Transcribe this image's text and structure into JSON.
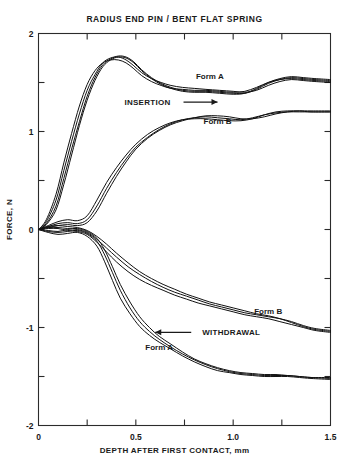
{
  "chart_data": {
    "type": "line",
    "title": "RADIUS END PIN / BENT FLAT SPRING",
    "xlabel": "DEPTH AFTER FIRST CONTACT, mm",
    "ylabel": "FORCE, N",
    "xlim": [
      0,
      1.5
    ],
    "ylim": [
      -2,
      2
    ],
    "grid": false,
    "legend_position": "inline-annotations",
    "xticks": [
      0,
      0.25,
      0.5,
      0.75,
      1.0,
      1.25,
      1.5
    ],
    "xtick_labels": [
      "0",
      "",
      "0.5",
      "",
      "1.0",
      "",
      "1.5"
    ],
    "yticks": [
      2,
      1.5,
      1,
      0.5,
      0,
      -0.5,
      -1,
      -1.5,
      -2
    ],
    "ytick_labels": [
      "2",
      "",
      "1",
      "",
      "0",
      "",
      "-1",
      "",
      "-2"
    ],
    "annotations": [
      {
        "text": "Form A",
        "x": 0.88,
        "y": 1.54,
        "group": "insertion"
      },
      {
        "text": "INSERTION",
        "x": 0.56,
        "y": 1.27,
        "group": "insertion",
        "arrow": "right"
      },
      {
        "text": "Form B",
        "x": 0.92,
        "y": 1.08,
        "group": "insertion"
      },
      {
        "text": "Form B",
        "x": 1.18,
        "y": -0.86,
        "group": "withdrawal"
      },
      {
        "text": "WITHDRAWAL",
        "x": 0.99,
        "y": -1.08,
        "group": "withdrawal",
        "arrow": "left"
      },
      {
        "text": "Form A",
        "x": 0.62,
        "y": -1.23,
        "group": "withdrawal"
      }
    ],
    "series": [
      {
        "name": "Form A insertion (trace 1)",
        "group": "insertion",
        "form": "A",
        "x": [
          0.0,
          0.04,
          0.09,
          0.13,
          0.17,
          0.21,
          0.25,
          0.29,
          0.33,
          0.37,
          0.41,
          0.45,
          0.49,
          0.53,
          0.58,
          0.63,
          0.68,
          0.74,
          0.8,
          0.86,
          0.93,
          1.0,
          1.06,
          1.12,
          1.18,
          1.24,
          1.3,
          1.36,
          1.42,
          1.5
        ],
        "y": [
          0.0,
          0.08,
          0.3,
          0.6,
          0.9,
          1.18,
          1.42,
          1.58,
          1.7,
          1.75,
          1.76,
          1.73,
          1.67,
          1.6,
          1.54,
          1.5,
          1.47,
          1.45,
          1.44,
          1.43,
          1.42,
          1.41,
          1.4,
          1.42,
          1.47,
          1.51,
          1.53,
          1.52,
          1.51,
          1.5
        ]
      },
      {
        "name": "Form A insertion (trace 2)",
        "group": "insertion",
        "form": "A",
        "x": [
          0.0,
          0.04,
          0.09,
          0.13,
          0.17,
          0.21,
          0.25,
          0.29,
          0.33,
          0.37,
          0.41,
          0.45,
          0.49,
          0.53,
          0.58,
          0.63,
          0.68,
          0.74,
          0.8,
          0.86,
          0.93,
          1.0,
          1.06,
          1.12,
          1.18,
          1.24,
          1.3,
          1.36,
          1.42,
          1.5
        ],
        "y": [
          0.0,
          0.06,
          0.24,
          0.52,
          0.82,
          1.1,
          1.36,
          1.55,
          1.68,
          1.74,
          1.77,
          1.76,
          1.71,
          1.63,
          1.55,
          1.49,
          1.45,
          1.42,
          1.41,
          1.41,
          1.4,
          1.39,
          1.39,
          1.43,
          1.49,
          1.53,
          1.55,
          1.54,
          1.53,
          1.52
        ]
      },
      {
        "name": "Form A insertion (trace 3)",
        "group": "insertion",
        "form": "A",
        "x": [
          0.0,
          0.04,
          0.09,
          0.13,
          0.17,
          0.21,
          0.25,
          0.29,
          0.33,
          0.37,
          0.41,
          0.45,
          0.49,
          0.53,
          0.58,
          0.63,
          0.68,
          0.74,
          0.8,
          0.86,
          0.93,
          1.0,
          1.06,
          1.12,
          1.18,
          1.24,
          1.3,
          1.36,
          1.42,
          1.5
        ],
        "y": [
          0.0,
          0.1,
          0.36,
          0.68,
          0.98,
          1.26,
          1.48,
          1.62,
          1.7,
          1.73,
          1.73,
          1.7,
          1.64,
          1.57,
          1.51,
          1.47,
          1.44,
          1.43,
          1.42,
          1.42,
          1.41,
          1.4,
          1.41,
          1.45,
          1.5,
          1.53,
          1.54,
          1.53,
          1.52,
          1.51
        ]
      },
      {
        "name": "Form A insertion (trace 4)",
        "group": "insertion",
        "form": "A",
        "x": [
          0.0,
          0.04,
          0.09,
          0.13,
          0.17,
          0.21,
          0.25,
          0.29,
          0.33,
          0.37,
          0.41,
          0.45,
          0.49,
          0.53,
          0.58,
          0.63,
          0.68,
          0.74,
          0.8,
          0.86,
          0.93,
          1.0,
          1.06,
          1.12,
          1.18,
          1.24,
          1.3,
          1.36,
          1.42,
          1.5
        ],
        "y": [
          0.0,
          0.05,
          0.2,
          0.46,
          0.76,
          1.06,
          1.32,
          1.52,
          1.66,
          1.73,
          1.76,
          1.75,
          1.7,
          1.62,
          1.54,
          1.48,
          1.44,
          1.41,
          1.4,
          1.4,
          1.39,
          1.38,
          1.39,
          1.44,
          1.5,
          1.54,
          1.56,
          1.55,
          1.54,
          1.53
        ]
      },
      {
        "name": "Form B insertion (trace 1)",
        "group": "insertion",
        "form": "B",
        "x": [
          0.0,
          0.05,
          0.1,
          0.15,
          0.2,
          0.25,
          0.3,
          0.35,
          0.4,
          0.45,
          0.5,
          0.56,
          0.62,
          0.68,
          0.74,
          0.8,
          0.86,
          0.92,
          0.98,
          1.04,
          1.1,
          1.16,
          1.22,
          1.28,
          1.34,
          1.4,
          1.5
        ],
        "y": [
          0.0,
          0.03,
          0.06,
          0.07,
          0.06,
          0.1,
          0.24,
          0.42,
          0.58,
          0.72,
          0.84,
          0.94,
          1.02,
          1.08,
          1.12,
          1.14,
          1.15,
          1.14,
          1.13,
          1.12,
          1.14,
          1.17,
          1.19,
          1.2,
          1.2,
          1.2,
          1.2
        ]
      },
      {
        "name": "Form B insertion (trace 2)",
        "group": "insertion",
        "form": "B",
        "x": [
          0.0,
          0.05,
          0.1,
          0.15,
          0.2,
          0.25,
          0.3,
          0.35,
          0.4,
          0.45,
          0.5,
          0.56,
          0.62,
          0.68,
          0.74,
          0.8,
          0.86,
          0.92,
          0.98,
          1.04,
          1.1,
          1.16,
          1.22,
          1.28,
          1.34,
          1.4,
          1.5
        ],
        "y": [
          0.0,
          0.04,
          0.08,
          0.1,
          0.09,
          0.14,
          0.3,
          0.48,
          0.63,
          0.76,
          0.87,
          0.97,
          1.04,
          1.09,
          1.12,
          1.13,
          1.13,
          1.12,
          1.11,
          1.11,
          1.13,
          1.17,
          1.2,
          1.21,
          1.21,
          1.2,
          1.2
        ]
      },
      {
        "name": "Form B insertion (trace 3)",
        "group": "insertion",
        "form": "B",
        "x": [
          0.0,
          0.05,
          0.1,
          0.15,
          0.2,
          0.25,
          0.3,
          0.35,
          0.4,
          0.45,
          0.5,
          0.56,
          0.62,
          0.68,
          0.74,
          0.8,
          0.86,
          0.92,
          0.98,
          1.04,
          1.1,
          1.16,
          1.22,
          1.28,
          1.34,
          1.4,
          1.5
        ],
        "y": [
          0.0,
          0.02,
          0.04,
          0.05,
          0.04,
          0.07,
          0.19,
          0.37,
          0.54,
          0.69,
          0.82,
          0.93,
          1.01,
          1.07,
          1.11,
          1.14,
          1.16,
          1.16,
          1.15,
          1.13,
          1.13,
          1.15,
          1.18,
          1.2,
          1.21,
          1.21,
          1.21
        ]
      },
      {
        "name": "Form A withdrawal (trace 1)",
        "group": "withdrawal",
        "form": "A",
        "x": [
          0.0,
          0.05,
          0.1,
          0.15,
          0.2,
          0.25,
          0.3,
          0.34,
          0.38,
          0.42,
          0.47,
          0.52,
          0.57,
          0.62,
          0.68,
          0.74,
          0.8,
          0.86,
          0.92,
          0.98,
          1.04,
          1.1,
          1.16,
          1.22,
          1.28,
          1.34,
          1.4,
          1.5
        ],
        "y": [
          0.0,
          -0.02,
          -0.03,
          -0.02,
          -0.01,
          -0.04,
          -0.12,
          -0.26,
          -0.44,
          -0.62,
          -0.8,
          -0.94,
          -1.04,
          -1.12,
          -1.2,
          -1.27,
          -1.33,
          -1.38,
          -1.42,
          -1.45,
          -1.47,
          -1.48,
          -1.49,
          -1.49,
          -1.49,
          -1.5,
          -1.51,
          -1.52
        ]
      },
      {
        "name": "Form A withdrawal (trace 2)",
        "group": "withdrawal",
        "form": "A",
        "x": [
          0.0,
          0.05,
          0.1,
          0.15,
          0.2,
          0.25,
          0.3,
          0.34,
          0.38,
          0.42,
          0.47,
          0.52,
          0.57,
          0.62,
          0.68,
          0.74,
          0.8,
          0.86,
          0.92,
          0.98,
          1.04,
          1.1,
          1.16,
          1.22,
          1.28,
          1.34,
          1.4,
          1.5
        ],
        "y": [
          0.0,
          -0.03,
          -0.05,
          -0.04,
          -0.03,
          -0.07,
          -0.17,
          -0.33,
          -0.52,
          -0.7,
          -0.86,
          -0.99,
          -1.08,
          -1.15,
          -1.22,
          -1.29,
          -1.35,
          -1.4,
          -1.44,
          -1.46,
          -1.48,
          -1.49,
          -1.5,
          -1.5,
          -1.5,
          -1.51,
          -1.52,
          -1.53
        ]
      },
      {
        "name": "Form A withdrawal (trace 3)",
        "group": "withdrawal",
        "form": "A",
        "x": [
          0.0,
          0.05,
          0.1,
          0.15,
          0.2,
          0.25,
          0.3,
          0.34,
          0.38,
          0.42,
          0.47,
          0.52,
          0.57,
          0.62,
          0.68,
          0.74,
          0.8,
          0.86,
          0.92,
          0.98,
          1.04,
          1.1,
          1.16,
          1.22,
          1.28,
          1.34,
          1.4,
          1.5
        ],
        "y": [
          0.0,
          -0.01,
          -0.02,
          0.0,
          0.01,
          -0.02,
          -0.09,
          -0.21,
          -0.38,
          -0.56,
          -0.74,
          -0.89,
          -1.0,
          -1.09,
          -1.17,
          -1.25,
          -1.32,
          -1.37,
          -1.41,
          -1.44,
          -1.46,
          -1.47,
          -1.48,
          -1.48,
          -1.49,
          -1.5,
          -1.51,
          -1.51
        ]
      },
      {
        "name": "Form B withdrawal (trace 1)",
        "group": "withdrawal",
        "form": "B",
        "x": [
          0.0,
          0.05,
          0.1,
          0.15,
          0.2,
          0.25,
          0.3,
          0.35,
          0.4,
          0.46,
          0.52,
          0.58,
          0.64,
          0.7,
          0.76,
          0.82,
          0.88,
          0.94,
          1.0,
          1.06,
          1.12,
          1.18,
          1.24,
          1.3,
          1.36,
          1.42,
          1.5
        ],
        "y": [
          0.0,
          0.02,
          0.02,
          0.01,
          0.0,
          -0.03,
          -0.1,
          -0.19,
          -0.28,
          -0.38,
          -0.46,
          -0.53,
          -0.59,
          -0.64,
          -0.68,
          -0.72,
          -0.76,
          -0.79,
          -0.82,
          -0.85,
          -0.87,
          -0.89,
          -0.91,
          -0.94,
          -0.98,
          -1.01,
          -1.03
        ]
      },
      {
        "name": "Form B withdrawal (trace 2)",
        "group": "withdrawal",
        "form": "B",
        "x": [
          0.0,
          0.05,
          0.1,
          0.15,
          0.2,
          0.25,
          0.3,
          0.35,
          0.4,
          0.46,
          0.52,
          0.58,
          0.64,
          0.7,
          0.76,
          0.82,
          0.88,
          0.94,
          1.0,
          1.06,
          1.12,
          1.18,
          1.24,
          1.3,
          1.36,
          1.42,
          1.5
        ],
        "y": [
          0.0,
          0.03,
          0.04,
          0.03,
          0.02,
          -0.01,
          -0.07,
          -0.15,
          -0.24,
          -0.34,
          -0.43,
          -0.5,
          -0.56,
          -0.61,
          -0.66,
          -0.7,
          -0.74,
          -0.77,
          -0.8,
          -0.83,
          -0.86,
          -0.88,
          -0.91,
          -0.95,
          -0.99,
          -1.02,
          -1.04
        ]
      },
      {
        "name": "Form B withdrawal (trace 3)",
        "group": "withdrawal",
        "form": "B",
        "x": [
          0.0,
          0.05,
          0.1,
          0.15,
          0.2,
          0.25,
          0.3,
          0.35,
          0.4,
          0.46,
          0.52,
          0.58,
          0.64,
          0.7,
          0.76,
          0.82,
          0.88,
          0.94,
          1.0,
          1.06,
          1.12,
          1.18,
          1.24,
          1.3,
          1.36,
          1.42,
          1.5
        ],
        "y": [
          0.0,
          0.01,
          0.01,
          -0.01,
          -0.02,
          -0.05,
          -0.13,
          -0.23,
          -0.33,
          -0.43,
          -0.51,
          -0.57,
          -0.62,
          -0.67,
          -0.71,
          -0.75,
          -0.78,
          -0.81,
          -0.84,
          -0.87,
          -0.89,
          -0.91,
          -0.94,
          -0.97,
          -1.0,
          -1.03,
          -1.05
        ]
      }
    ]
  }
}
